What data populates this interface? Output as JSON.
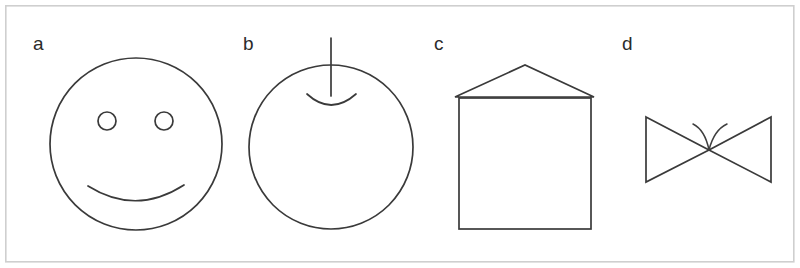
{
  "figure": {
    "width": 800,
    "height": 268,
    "background_color": "#ffffff",
    "frame": {
      "name": "outer-border",
      "x": 5,
      "y": 5,
      "width": 789,
      "height": 257,
      "stroke_color": "#cfcfcf"
    },
    "stroke_color": "#3a3a3a",
    "panels": [
      {
        "label": "a",
        "label_x": 33,
        "label_y": 50,
        "shape_name": "smiley-face",
        "description": "circle with two small circular eyes and an upward-curving mouth arc",
        "geometry": {
          "face_circle": {
            "cx": 136,
            "cy": 144,
            "r": 86
          },
          "eye_left": {
            "cx": 107,
            "cy": 121,
            "r": 9
          },
          "eye_right": {
            "cx": 164,
            "cy": 121,
            "r": 9
          },
          "mouth_path": "M 88 186 Q 136 216 184 185"
        }
      },
      {
        "label": "b",
        "label_x": 243,
        "label_y": 50,
        "shape_name": "apple-fruit",
        "description": "circle with a vertical stem line and a small concave dimple arc at the top",
        "geometry": {
          "body_circle": {
            "cx": 331,
            "cy": 147,
            "r": 82
          },
          "stem_line": {
            "x1": 331,
            "y1": 38,
            "x2": 331,
            "y2": 96
          },
          "dimple_path": "M 307 94 Q 331 116 356 94"
        }
      },
      {
        "label": "c",
        "label_x": 434,
        "label_y": 50,
        "shape_name": "house",
        "description": "square body with a triangular gable roof whose eaves overhang the walls",
        "geometry": {
          "body_rect": {
            "x": 459,
            "y": 98,
            "width": 132,
            "height": 131
          },
          "roof_path": "M 455 97 L 525 65 L 594 97 Z"
        }
      },
      {
        "label": "d",
        "label_x": 622,
        "label_y": 50,
        "shape_name": "bowtie",
        "description": "two mirrored triangles meeting at a center point with a small two-armed sprout curve above the junction",
        "geometry": {
          "left_triangle": "M 646 117 L 709 150 L 646 182 Z",
          "right_triangle": "M 771 117 L 709 150 L 771 182 Z",
          "sprout_left_path": "M 694 124 Q 705 131 709 150",
          "sprout_right_path": "M 726 124 Q 714 131 709 150"
        }
      }
    ]
  }
}
